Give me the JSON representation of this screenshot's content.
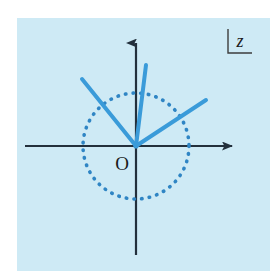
{
  "figure": {
    "panel": {
      "fill_color": "#cdeaf5",
      "x": 17,
      "y": 18,
      "width": 253,
      "height": 253
    },
    "page_background": "#ffffff"
  },
  "axes": {
    "color": "#23303c",
    "stroke_width": 2.2,
    "origin": {
      "x": 136,
      "y": 146
    },
    "horizontal": {
      "label": "real-axis",
      "x_start": 25,
      "x_end": 240,
      "y": 146,
      "arrow": "right"
    },
    "vertical": {
      "label": "imaginary-axis",
      "x": 136,
      "y_start": 255,
      "y_end": 33,
      "arrow": "up"
    }
  },
  "circle": {
    "label": "unit-circle",
    "center_x": 136,
    "center_y": 146,
    "radius": 53,
    "style": "dotted",
    "color": "#2f85c4",
    "stroke_width": 3.6,
    "dash": "0.5 7.2"
  },
  "rays": {
    "color": "#3a9bd9",
    "stroke_width": 4.0,
    "items": [
      {
        "name": "ray-upper-left",
        "angle_deg": 148,
        "x1": 136,
        "y1": 146,
        "x2": 82,
        "y2": 79
      },
      {
        "name": "ray-steep-upper",
        "angle_deg": 103,
        "x1": 136,
        "y1": 146,
        "x2": 146,
        "y2": 65
      },
      {
        "name": "ray-right",
        "angle_deg": 33,
        "x1": 136,
        "y1": 146,
        "x2": 206,
        "y2": 100
      }
    ]
  },
  "labels": {
    "origin": {
      "text": "O",
      "x": 122,
      "y": 170,
      "font_size": 19,
      "color": "#1b1b1b",
      "style": "normal"
    },
    "variable": {
      "text": "z",
      "x": 240,
      "y": 46,
      "font_size": 18,
      "color": "#1b1b1b",
      "style": "italic"
    }
  },
  "bracket": {
    "name": "corner-bracket",
    "color": "#3d3d3d",
    "stroke_width": 1.4,
    "vertical": {
      "x": 228,
      "y1": 29,
      "y2": 53
    },
    "horizontal": {
      "y": 53,
      "x1": 228,
      "x2": 252
    }
  },
  "chart_data": {
    "type": "scatter",
    "xlabel": "",
    "ylabel": "",
    "xlim": [
      -2.1,
      2.1
    ],
    "ylim": [
      -2.1,
      2.1
    ],
    "grid": false,
    "legend": null,
    "annotations": [
      "O",
      "z"
    ],
    "series": [
      {
        "name": "unit-circle",
        "kind": "circle",
        "center": [
          0,
          0
        ],
        "radius": 1.0,
        "linestyle": "dotted"
      },
      {
        "name": "ray-upper-left",
        "kind": "ray",
        "from": [
          0,
          0
        ],
        "to": [
          -1.62,
          1.01
        ],
        "angle_deg": 148,
        "length": 1.91
      },
      {
        "name": "ray-steep-upper",
        "kind": "ray",
        "from": [
          0,
          0
        ],
        "to": [
          -0.3,
          1.29
        ],
        "angle_deg": 103,
        "length": 1.32
      },
      {
        "name": "ray-right",
        "kind": "ray",
        "from": [
          0,
          0
        ],
        "to": [
          1.43,
          0.93
        ],
        "angle_deg": 33,
        "length": 1.71
      }
    ]
  }
}
